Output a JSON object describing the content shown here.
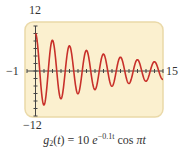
{
  "chart_data": {
    "type": "line",
    "title": "",
    "caption": {
      "func": "g",
      "subscript": "2",
      "arg": "t",
      "equals": "= 10",
      "base": "e",
      "exponent": "−0.1t",
      "trig": "cos",
      "trig_arg": "πt"
    },
    "expression": "g2(t) = 10 e^(−0.1t) cos πt",
    "xlabel": "",
    "ylabel": "",
    "xlim": [
      -1,
      15
    ],
    "ylim": [
      -12,
      12
    ],
    "x_tick_labels": {
      "min": "−1",
      "max": "15"
    },
    "y_tick_labels": {
      "max": "12",
      "min": "−12"
    },
    "x_tick_step": 1,
    "y_tick_step": 2,
    "grid": false,
    "legend": null,
    "series": [
      {
        "name": "g2(t)",
        "color": "#C8302A",
        "domain": [
          0,
          15
        ],
        "x": [
          0,
          0.5,
          1,
          1.5,
          2,
          2.5,
          3,
          3.5,
          4,
          4.5,
          5,
          5.5,
          6,
          6.5,
          7,
          7.5,
          8,
          8.5,
          9,
          9.5,
          10,
          10.5,
          11,
          11.5,
          12,
          12.5,
          13,
          13.5,
          14,
          14.5,
          15
        ],
        "values": [
          10,
          0,
          -9.05,
          0,
          8.19,
          0,
          -7.41,
          0,
          6.7,
          0,
          -6.07,
          0,
          5.49,
          0,
          -4.97,
          0,
          4.49,
          0,
          -4.07,
          0,
          3.68,
          0,
          -3.33,
          0,
          3.01,
          0,
          -2.73,
          0,
          2.47,
          0,
          -2.23
        ]
      }
    ]
  },
  "colors": {
    "plot_background": "#FBF0CF",
    "plot_border": "#EAD9A8",
    "axis": "#444444",
    "curve": "#C8302A",
    "text": "#333333"
  }
}
